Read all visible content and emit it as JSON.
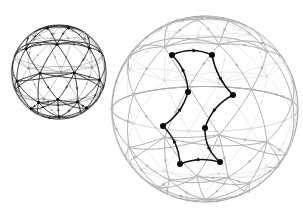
{
  "figure": {
    "background_color": "#ffffff",
    "canvas": {
      "width": 303,
      "height": 221
    },
    "colors": {
      "outline_dark": "#555555",
      "outline_light": "#b9b9b9",
      "edge_dark": "#2b2b2b",
      "edge_mid": "#6e6e6e",
      "edge_light": "#c2c2c2",
      "edge_faint": "#d8d8d8",
      "node_dark": "#111111",
      "node_light": "#b5b5b5",
      "highlight": "#111111"
    }
  },
  "spheres": [
    {
      "id": "small-sphere",
      "label": "Small sphere",
      "center": {
        "x": 59,
        "y": 72
      },
      "radius": 47,
      "squash": 1.0,
      "rendering": "all-edges-dark",
      "outline_color": "#4a4a4a",
      "outline_width": 1.1,
      "node_radius": 1.6,
      "node_color": "#111111",
      "front_edge_color": "#2f2f2f",
      "back_edge_color": "#8e8e8e",
      "front_edge_width": 0.95,
      "back_edge_width": 0.7,
      "arrow_size": 2.0,
      "arrow_color": "#2f2f2f",
      "tilt_deg": -18,
      "lat_rings": 4,
      "lon_count": 8
    },
    {
      "id": "large-sphere",
      "label": "Large sphere",
      "center": {
        "x": 205,
        "y": 109
      },
      "radius": 93,
      "squash": 1.0,
      "rendering": "faded-with-dark-highlight-cycle",
      "outline_color": "#9a9a9a",
      "outline_width": 1.0,
      "node_radius": 1.7,
      "node_color": "#bdbdbd",
      "front_edge_color": "#b0b0b0",
      "back_edge_color": "#dcdcdc",
      "front_edge_width": 1.0,
      "back_edge_width": 0.8,
      "arrow_size": 2.4,
      "arrow_color": "#b0b0b0",
      "tilt_deg": -14,
      "lat_rings": 5,
      "lon_count": 9
    }
  ],
  "highlight_cycle": {
    "label": "Highlighted directed cycle",
    "stroke_color": "#141414",
    "stroke_width": 1.5,
    "node_color": "#0b0b0b",
    "node_radius": 3.0,
    "arrow_color": "#141414",
    "arrow_size": 3.2,
    "nodes": [
      {
        "id": "n1",
        "x": 172,
        "y": 55
      },
      {
        "id": "n2",
        "x": 212,
        "y": 55
      },
      {
        "id": "n3",
        "x": 233,
        "y": 95
      },
      {
        "id": "n4",
        "x": 188,
        "y": 92
      },
      {
        "id": "n5",
        "x": 205,
        "y": 128
      },
      {
        "id": "n6",
        "x": 220,
        "y": 162
      },
      {
        "id": "n7",
        "x": 180,
        "y": 164
      },
      {
        "id": "n8",
        "x": 163,
        "y": 126
      }
    ],
    "edges": [
      {
        "from": "n1",
        "to": "n2",
        "bow": -9
      },
      {
        "from": "n2",
        "to": "n3",
        "bow": 7
      },
      {
        "from": "n3",
        "to": "n5",
        "bow": 9
      },
      {
        "from": "n5",
        "to": "n6",
        "bow": 9
      },
      {
        "from": "n6",
        "to": "n7",
        "bow": 7
      },
      {
        "from": "n7",
        "to": "n8",
        "bow": 8
      },
      {
        "from": "n8",
        "to": "n4",
        "bow": 8
      },
      {
        "from": "n4",
        "to": "n1",
        "bow": 8
      }
    ]
  },
  "annotations": {
    "count_highlight_nodes": 8,
    "count_spheres": 2
  }
}
